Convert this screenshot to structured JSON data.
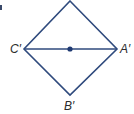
{
  "diagram": {
    "type": "geometry",
    "stroke_color": "#2f4a7d",
    "shape": "rhombus",
    "vertices": {
      "top": {
        "x": 70,
        "y": 1
      },
      "left": {
        "x": 24,
        "y": 49,
        "label": "C′"
      },
      "right": {
        "x": 117,
        "y": 49,
        "label": "A′"
      },
      "bottom": {
        "x": 70,
        "y": 95,
        "label": "B′"
      }
    },
    "diagonal": {
      "from": "C′",
      "to": "A′"
    },
    "center_point": {
      "x": 70,
      "y": 49
    }
  },
  "labels": {
    "c_prime": "C′",
    "a_prime": "A′",
    "b_prime": "B′"
  }
}
